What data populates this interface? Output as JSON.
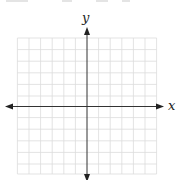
{
  "figure": {
    "type": "blank coordinate plane",
    "x_axis_label": "x",
    "y_axis_label": "y",
    "grid": {
      "columns_left_of_y_axis": 6,
      "columns_right_of_y_axis": 6,
      "rows_above_x_axis": 6,
      "rows_below_x_axis": 6,
      "cell_size_px": 11.6
    },
    "arrows": {
      "x_axis": "both-ends",
      "y_axis": "both-ends"
    },
    "colors": {
      "grid_line": "#dcdcdc",
      "axis_line": "#333333",
      "label": "#222222",
      "background": "#ffffff"
    }
  }
}
